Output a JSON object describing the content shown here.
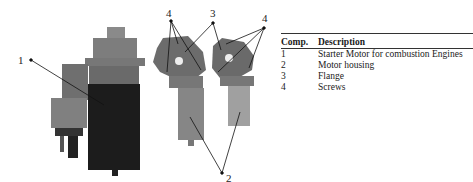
{
  "figure": {
    "callouts": [
      {
        "id": "1",
        "x": 18,
        "y": 56
      },
      {
        "id": "4",
        "x": 169,
        "y": 11
      },
      {
        "id": "3",
        "x": 208,
        "y": 11
      },
      {
        "id": "4",
        "x": 262,
        "y": 15
      },
      {
        "id": "2",
        "x": 224,
        "y": 173
      }
    ]
  },
  "table": {
    "headers": [
      "Comp.",
      "Description"
    ],
    "rows": [
      [
        "1",
        "Starter Motor for combustion Engines"
      ],
      [
        "2",
        "Motor housing"
      ],
      [
        "3",
        "Flange"
      ],
      [
        "4",
        "Screws"
      ]
    ]
  }
}
